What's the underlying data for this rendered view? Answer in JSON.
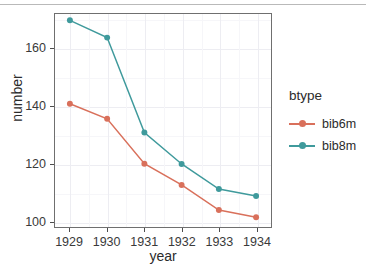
{
  "chart_data": {
    "type": "line",
    "title": "",
    "xlabel": "year",
    "ylabel": "number",
    "legend_title": "btype",
    "legend_position": "right",
    "grid": true,
    "x": [
      1929,
      1930,
      1931,
      1932,
      1933,
      1934
    ],
    "xtick_labels": [
      "1929",
      "1930",
      "1931",
      "1932",
      "1933",
      "1934"
    ],
    "ytick_labels": [
      "100",
      "120",
      "140",
      "160"
    ],
    "yticks": [
      100,
      120,
      140,
      160
    ],
    "ylim": [
      98,
      172
    ],
    "xlim": [
      1928.6,
      1934.4
    ],
    "series": [
      {
        "name": "bib6m",
        "color": "#d9705b",
        "values": [
          140.8,
          135.6,
          120.0,
          112.6,
          103.9,
          101.4
        ]
      },
      {
        "name": "bib8m",
        "color": "#3f9a9c",
        "values": [
          169.8,
          163.8,
          130.8,
          119.9,
          111.2,
          108.8
        ]
      }
    ]
  },
  "axis": {
    "x_title": "year",
    "y_title": "number"
  },
  "legend": {
    "title": "btype",
    "entries": [
      {
        "label": "bib6m",
        "color": "#d9705b"
      },
      {
        "label": "bib8m",
        "color": "#3f9a9c"
      }
    ]
  }
}
